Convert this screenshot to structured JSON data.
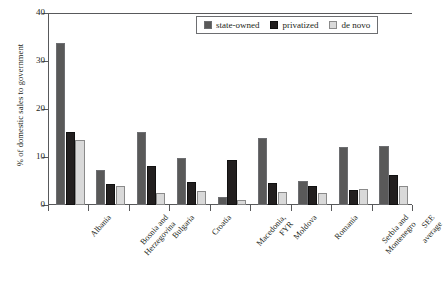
{
  "chart_data": {
    "type": "bar",
    "title": "",
    "xlabel": "",
    "ylabel": "% of domestic sales to government",
    "ylim": [
      0,
      40
    ],
    "yticks": [
      0,
      10,
      20,
      30,
      40
    ],
    "grid": false,
    "legend_position": "top-right",
    "categories": [
      "Albania",
      "Bosnia and\nHerzegovina",
      "Bulgaria",
      "Croatia",
      "Macedonia,\nFYR",
      "Moldova",
      "Romania",
      "Serbia and\nMontenegro",
      "SEE average"
    ],
    "series": [
      {
        "name": "state-owned",
        "color": "#595959",
        "values": [
          33.7,
          7.2,
          15.2,
          9.8,
          1.7,
          13.9,
          4.9,
          12.1,
          12.3
        ]
      },
      {
        "name": "privatized",
        "color": "#221f1f",
        "values": [
          15.2,
          4.3,
          8.2,
          4.8,
          9.4,
          4.6,
          4.0,
          3.2,
          6.2
        ]
      },
      {
        "name": "de novo",
        "color": "#d9d9d9",
        "values": [
          13.6,
          4.0,
          2.4,
          2.9,
          1.1,
          2.8,
          2.5,
          3.3,
          4.0
        ]
      }
    ]
  },
  "legend": {
    "items": [
      {
        "label": "state-owned"
      },
      {
        "label": "privatized"
      },
      {
        "label": "de novo"
      }
    ]
  }
}
